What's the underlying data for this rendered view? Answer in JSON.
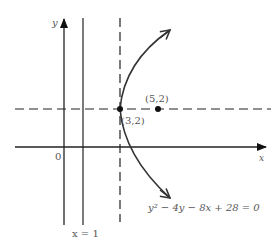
{
  "diagram": {
    "type": "coordinate-graph",
    "axes": {
      "x_label": "x",
      "y_label": "y",
      "origin_label": "0"
    },
    "curve": {
      "equation": "y² − 4y − 8x + 28 = 0",
      "type": "parabola",
      "opens": "right"
    },
    "points": [
      {
        "label": "(3,2)",
        "role": "vertex",
        "x": 3,
        "y": 2
      },
      {
        "label": "(5,2)",
        "role": "focus",
        "x": 5,
        "y": 2
      }
    ],
    "lines": [
      {
        "label": "x = 1",
        "style": "solid",
        "role": "directrix"
      },
      {
        "label": "",
        "style": "dashed",
        "role": "vertical line through vertex (x = 3)"
      },
      {
        "label": "",
        "style": "dashed",
        "role": "axis of symmetry (y = 2)"
      }
    ],
    "colors": {
      "line": "#222222",
      "text": "#555555"
    }
  }
}
